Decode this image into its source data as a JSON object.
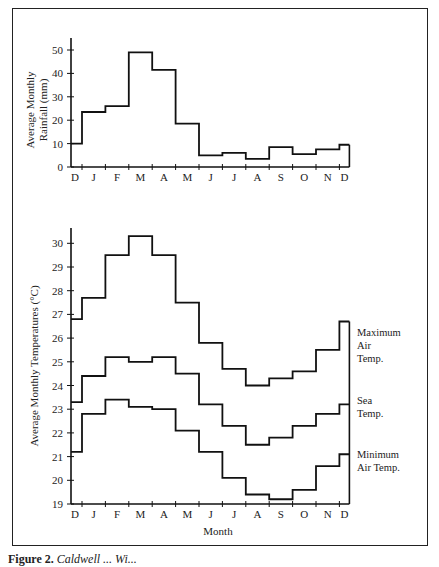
{
  "figure": {
    "caption_label": "Figure 2.",
    "caption_text": "Caldwell ... Wi..."
  },
  "chart_data": [
    {
      "type": "bar",
      "style": "step",
      "title": "",
      "xlabel": "",
      "ylabel": "Average Monthly Rainfall (mm)",
      "ylabel_lines": [
        "Average Monthly",
        "Rainfall (mm)"
      ],
      "ylim": [
        0,
        55
      ],
      "yticks": [
        0,
        10,
        20,
        30,
        40,
        50
      ],
      "categories": [
        "D",
        "J",
        "F",
        "M",
        "A",
        "M",
        "J",
        "J",
        "A",
        "S",
        "O",
        "N",
        "D"
      ],
      "values": [
        10,
        23.5,
        26,
        49,
        41.5,
        18.5,
        5,
        6,
        3.5,
        8.5,
        5.5,
        7.5,
        9.5
      ],
      "grid": false
    },
    {
      "type": "line",
      "style": "step",
      "title": "",
      "xlabel": "Month",
      "ylabel": "Average Monthly Temperatures (°C)",
      "ylim": [
        19,
        30.5
      ],
      "yticks": [
        19,
        20,
        21,
        22,
        23,
        24,
        25,
        26,
        27,
        28,
        29,
        30
      ],
      "categories": [
        "D",
        "J",
        "F",
        "M",
        "A",
        "M",
        "J",
        "J",
        "A",
        "S",
        "O",
        "N",
        "D"
      ],
      "series": [
        {
          "name": "Maximum Air Temp.",
          "label_lines": [
            "Maximum",
            "Air",
            "Temp."
          ],
          "values": [
            26.8,
            27.7,
            29.5,
            30.3,
            29.5,
            27.5,
            25.8,
            24.7,
            24.0,
            24.3,
            24.6,
            25.5,
            26.7
          ]
        },
        {
          "name": "Sea Temp.",
          "label_lines": [
            "Sea",
            "Temp."
          ],
          "values": [
            23.3,
            24.4,
            25.2,
            25.0,
            25.2,
            24.5,
            23.2,
            22.3,
            21.5,
            21.8,
            22.3,
            22.8,
            23.2
          ]
        },
        {
          "name": "Minimum Air Temp.",
          "label_lines": [
            "Minimum",
            "Air Temp."
          ],
          "values": [
            21.2,
            22.8,
            23.4,
            23.1,
            23.0,
            22.1,
            21.2,
            20.1,
            19.4,
            19.2,
            19.6,
            20.6,
            21.1
          ]
        }
      ],
      "legend_position": "right-inline",
      "grid": false
    }
  ]
}
